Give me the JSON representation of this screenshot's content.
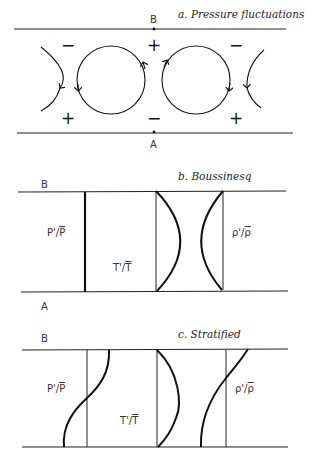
{
  "figure": {
    "panels": [
      {
        "id": "a",
        "title": "a. Pressure fluctuations",
        "top_label": "B",
        "bottom_label": "A",
        "signs_top": [
          "−",
          "+",
          "−"
        ],
        "signs_bottom": [
          "+",
          "−",
          "+"
        ],
        "elements": [
          "left partial vortex (clockwise, arrow down)",
          "vortex 1 (counter-clockwise)",
          "vortex 2 (clockwise)",
          "right partial vortex (arrow down)"
        ]
      },
      {
        "id": "b",
        "title": "b. Boussinesq",
        "top_label": "B",
        "bottom_label": "A",
        "profiles": [
          {
            "label_num": "P'/",
            "label_den": "P",
            "shape": "straight vertical line (zero)"
          },
          {
            "label_num": "T'/",
            "label_den": "T",
            "shape": "symmetric bulge to the right"
          },
          {
            "label_num": "ρ'/",
            "label_den": "ρ",
            "shape": "symmetric bulge to the left"
          }
        ]
      },
      {
        "id": "c",
        "title": "c. Stratified",
        "top_label": "B",
        "profiles": [
          {
            "label_num": "P'/",
            "label_den": "P",
            "shape": "S-curve, positive at top, negative at bottom"
          },
          {
            "label_num": "T'/",
            "label_den": "T",
            "shape": "asymmetric bulge to the right"
          },
          {
            "label_num": "ρ'/",
            "label_den": "ρ",
            "shape": "curve crossing from positive at top to negative at bottom"
          }
        ]
      }
    ]
  }
}
